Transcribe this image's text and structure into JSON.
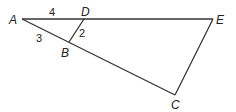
{
  "diagram": {
    "points": {
      "A": {
        "label": "A",
        "x": 22,
        "y": 19
      },
      "D": {
        "label": "D",
        "x": 84,
        "y": 19
      },
      "E": {
        "label": "E",
        "x": 213,
        "y": 19
      },
      "B": {
        "label": "B",
        "x": 69,
        "y": 42
      },
      "C": {
        "label": "C",
        "x": 175,
        "y": 95
      }
    },
    "segments": [
      {
        "from": "A",
        "to": "E"
      },
      {
        "from": "A",
        "to": "C"
      },
      {
        "from": "D",
        "to": "B"
      },
      {
        "from": "E",
        "to": "C"
      }
    ],
    "measures": {
      "AD": "4",
      "AB": "3",
      "DB": "2"
    },
    "line_color": "#333333"
  }
}
